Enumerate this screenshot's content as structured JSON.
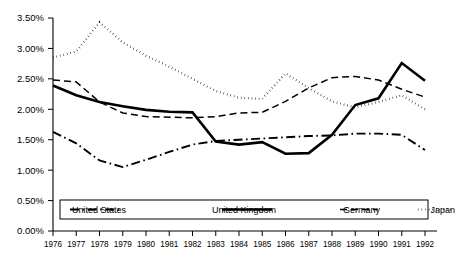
{
  "chart_data": {
    "type": "line",
    "title": "",
    "subtitle": "",
    "xlabel": "",
    "ylabel": "",
    "x": [
      1976,
      1977,
      1978,
      1979,
      1980,
      1981,
      1982,
      1983,
      1984,
      1985,
      1986,
      1987,
      1988,
      1989,
      1990,
      1991,
      1992
    ],
    "xtick_labels": [
      "1976",
      "1977",
      "1978",
      "1979",
      "1980",
      "1981",
      "1982",
      "1983",
      "1984",
      "1985",
      "1986",
      "1987",
      "1988",
      "1989",
      "1990",
      "1991",
      "1992"
    ],
    "ytick_labels": [
      "0.00%",
      "0.50%",
      "1.00%",
      "1.50%",
      "2.00%",
      "2.50%",
      "3.00%",
      "3.50%"
    ],
    "ytick_values": [
      0.0,
      0.5,
      1.0,
      1.5,
      2.0,
      2.5,
      3.0,
      3.5
    ],
    "ylim": [
      0.0,
      3.5
    ],
    "xlim": [
      1976,
      1992
    ],
    "grid": false,
    "legend_position": "bottom-inside",
    "value_unit": "percent",
    "series": [
      {
        "name": "United States",
        "style": "dash-dot",
        "color": "#000000",
        "values": [
          1.63,
          1.44,
          1.16,
          1.05,
          1.17,
          1.3,
          1.42,
          1.48,
          1.5,
          1.52,
          1.54,
          1.56,
          1.57,
          1.6,
          1.6,
          1.58,
          1.33
        ]
      },
      {
        "name": "United Kingdom",
        "style": "solid",
        "color": "#000000",
        "values": [
          2.39,
          2.23,
          2.12,
          2.05,
          1.99,
          1.96,
          1.95,
          1.47,
          1.42,
          1.46,
          1.27,
          1.28,
          1.58,
          2.07,
          2.18,
          2.76,
          2.47
        ]
      },
      {
        "name": "Germany",
        "style": "dashed",
        "color": "#000000",
        "values": [
          2.48,
          2.45,
          2.12,
          1.94,
          1.88,
          1.87,
          1.86,
          1.88,
          1.94,
          1.95,
          2.13,
          2.35,
          2.52,
          2.54,
          2.48,
          2.33,
          2.2
        ]
      },
      {
        "name": "Japan",
        "style": "dotted",
        "color": "#000000",
        "values": [
          2.85,
          2.95,
          3.43,
          3.1,
          2.88,
          2.7,
          2.5,
          2.3,
          2.19,
          2.17,
          2.59,
          2.35,
          2.13,
          2.03,
          2.12,
          2.23,
          2.0
        ]
      }
    ]
  },
  "legend": {
    "entries": [
      {
        "label": "United States",
        "style": "dash-dot"
      },
      {
        "label": "United Kingdom",
        "style": "solid"
      },
      {
        "label": "Germany",
        "style": "dashed"
      },
      {
        "label": "Japan",
        "style": "dotted"
      }
    ]
  }
}
